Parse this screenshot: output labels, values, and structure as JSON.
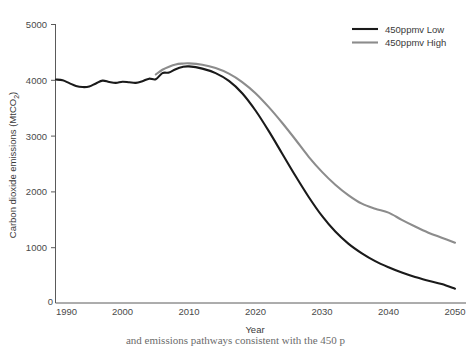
{
  "chart_data": {
    "type": "line",
    "title": "",
    "xlabel": "Year",
    "ylabel": "Carbon dioxide emissions (MtCO2)",
    "ylabel_display": "Carbon dioxide emissions (MtCO",
    "ylabel_sub": "2",
    "ylabel_tail": ")",
    "xlim": [
      1990,
      2050
    ],
    "ylim": [
      0,
      5000
    ],
    "grid": false,
    "legend_position": "top-right",
    "xticks": [
      1990,
      2000,
      2010,
      2020,
      2030,
      2040,
      2050
    ],
    "xtick_labels": [
      "1990",
      "2000",
      "2010",
      "2020",
      "2030",
      "2040",
      "2050"
    ],
    "yticks": [
      0,
      1000,
      2000,
      3000,
      4000,
      5000
    ],
    "ytick_labels": [
      "0",
      "1000",
      "2000",
      "3000",
      "4000",
      "5000"
    ],
    "series": [
      {
        "name": "450ppmv Low",
        "color": "#1a1a1a",
        "x": [
          1990,
          1991,
          1992,
          1993,
          1994,
          1995,
          1996,
          1997,
          1998,
          1999,
          2000,
          2001,
          2002,
          2003,
          2004,
          2005,
          2006,
          2007,
          2008,
          2009,
          2010,
          2012,
          2014,
          2016,
          2018,
          2020,
          2022,
          2024,
          2026,
          2028,
          2030,
          2032,
          2034,
          2036,
          2038,
          2040,
          2042,
          2044,
          2046,
          2048,
          2050
        ],
        "values": [
          4005,
          3990,
          3940,
          3890,
          3870,
          3880,
          3935,
          3985,
          3960,
          3945,
          3965,
          3955,
          3945,
          3975,
          4020,
          4010,
          4120,
          4130,
          4190,
          4230,
          4240,
          4200,
          4120,
          3980,
          3760,
          3450,
          3080,
          2680,
          2280,
          1900,
          1560,
          1280,
          1060,
          890,
          750,
          640,
          545,
          465,
          400,
          340,
          255
        ]
      },
      {
        "name": "450ppmv High",
        "color": "#8c8c8c",
        "x": [
          2005,
          2006,
          2007,
          2008,
          2009,
          2010,
          2012,
          2014,
          2016,
          2018,
          2020,
          2022,
          2024,
          2026,
          2028,
          2030,
          2032,
          2034,
          2036,
          2038,
          2040,
          2042,
          2044,
          2046,
          2048,
          2050
        ],
        "values": [
          4095,
          4180,
          4235,
          4275,
          4290,
          4295,
          4270,
          4210,
          4110,
          3960,
          3760,
          3510,
          3230,
          2930,
          2620,
          2350,
          2120,
          1930,
          1780,
          1690,
          1620,
          1490,
          1370,
          1260,
          1170,
          1080
        ]
      }
    ]
  },
  "legend": {
    "items": [
      {
        "label": "450ppmv Low",
        "color": "#1a1a1a"
      },
      {
        "label": "450ppmv High",
        "color": "#8c8c8c"
      }
    ]
  },
  "footer": {
    "partial_text": "and emissions pathways consistent with the 450 p"
  }
}
